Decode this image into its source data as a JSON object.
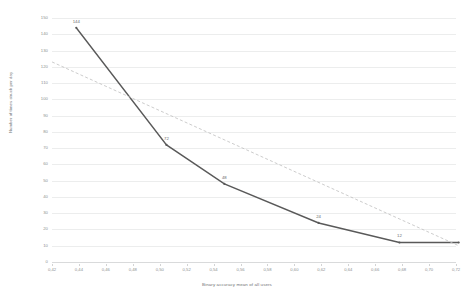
{
  "chart_data": {
    "type": "line",
    "title": "",
    "xlabel": "Binary accuracy mean of all users",
    "ylabel": "Number of times struck per day",
    "xlim": [
      0.42,
      0.72
    ],
    "ylim": [
      0,
      150
    ],
    "grid": true,
    "legend": "none",
    "x_ticks": [
      "0,42",
      "0,44",
      "0,46",
      "0,48",
      "0,50",
      "0,52",
      "0,54",
      "0,56",
      "0,58",
      "0,60",
      "0,62",
      "0,64",
      "0,66",
      "0,68",
      "0,70",
      "0,72"
    ],
    "x_tick_values": [
      0.42,
      0.44,
      0.46,
      0.48,
      0.5,
      0.52,
      0.54,
      0.56,
      0.58,
      0.6,
      0.62,
      0.64,
      0.66,
      0.68,
      0.7,
      0.72
    ],
    "y_ticks": [
      "150",
      "140",
      "130",
      "120",
      "110",
      "100",
      "90",
      "80",
      "70",
      "60",
      "50",
      "40",
      "30",
      "20",
      "10",
      "0"
    ],
    "y_tick_values": [
      150,
      140,
      130,
      120,
      110,
      100,
      90,
      80,
      70,
      60,
      50,
      40,
      30,
      20,
      10,
      0
    ],
    "series": [
      {
        "name": "Number of times struck per day",
        "style": "solid",
        "color": "#595959",
        "x": [
          0.438,
          0.505,
          0.548,
          0.618,
          0.678,
          0.722
        ],
        "y": [
          144,
          72,
          48,
          24,
          12,
          12
        ],
        "point_labels": [
          "144",
          "72",
          "48",
          "24",
          "12",
          ""
        ]
      },
      {
        "name": "Linear trend",
        "style": "dashed",
        "color": "#bfbfbf",
        "x": [
          0.42,
          0.722
        ],
        "y": [
          123,
          10
        ],
        "point_labels": [
          "",
          ""
        ]
      }
    ]
  }
}
